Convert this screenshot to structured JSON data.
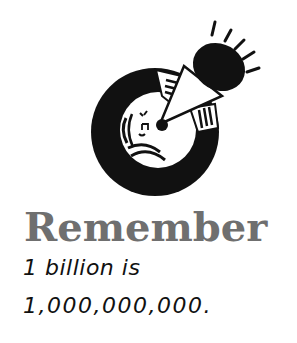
{
  "icon": {
    "name": "remember-megaphone-icon",
    "description": "Person shouting into a megaphone inside a black circle"
  },
  "heading": {
    "text": "Remember"
  },
  "body": {
    "line1": "1 billion is",
    "line2": "1,000,000,000."
  },
  "colors": {
    "heading": "#6f6f6f",
    "body": "#111111",
    "icon": "#111111",
    "background": "#ffffff"
  }
}
